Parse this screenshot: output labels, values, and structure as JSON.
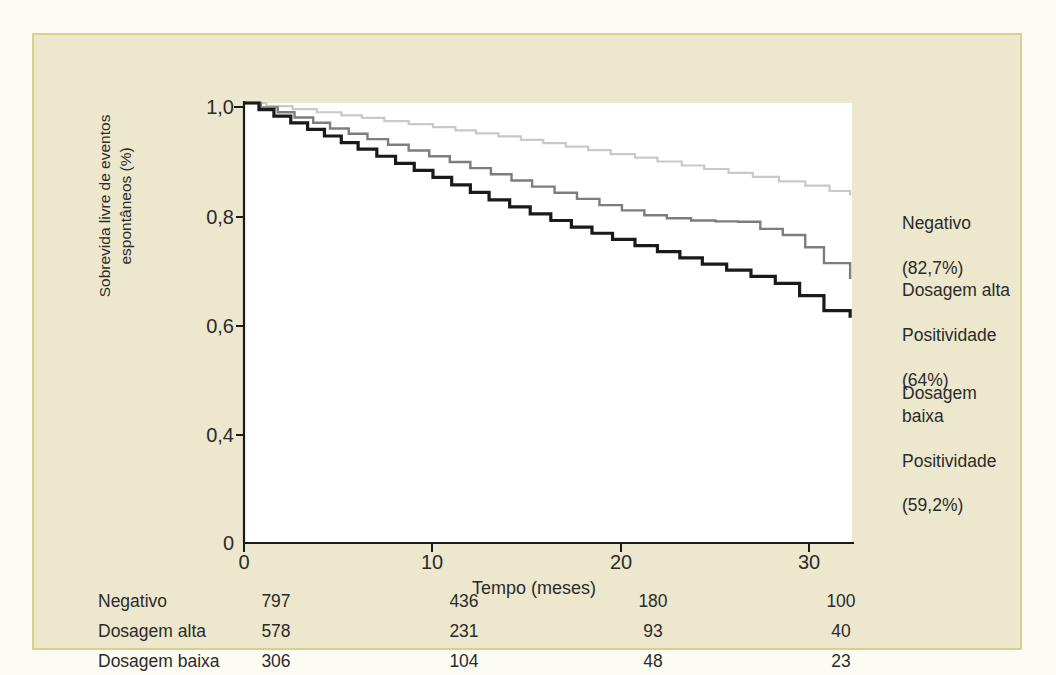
{
  "chart_data": {
    "type": "line",
    "title": "",
    "xlabel": "Tempo (meses)",
    "ylabel": "Sobrevida livre de eventos espontâneos (%)",
    "xlim": [
      0,
      32.5
    ],
    "ylim": [
      0,
      1.0
    ],
    "xticks": [
      0,
      10,
      20,
      30
    ],
    "xticklabels": [
      "0",
      "10",
      "20",
      "30"
    ],
    "yticks": [
      0,
      0.4,
      0.6,
      0.8,
      1.0
    ],
    "yticklabels": [
      "0",
      "0,4",
      "0,6",
      "0,8",
      "1,0"
    ],
    "grid": false,
    "legend_position": "right",
    "step_style": "post",
    "series": [
      {
        "name": "Negativo",
        "annotation": "Negativo\n(82,7%)",
        "final_value": "82,7%",
        "color": "#c9c9c9",
        "x": [
          0,
          1.2,
          2.6,
          3.9,
          5.2,
          6.3,
          7.5,
          8.8,
          10.1,
          11.3,
          12.4,
          13.6,
          14.8,
          16.0,
          17.2,
          18.4,
          19.6,
          20.9,
          22.1,
          23.4,
          24.6,
          25.9,
          27.2,
          28.6,
          30.0,
          31.3,
          32.4
        ],
        "y": [
          1.0,
          0.993,
          0.986,
          0.979,
          0.972,
          0.966,
          0.959,
          0.952,
          0.945,
          0.938,
          0.931,
          0.924,
          0.916,
          0.909,
          0.901,
          0.893,
          0.884,
          0.876,
          0.867,
          0.858,
          0.85,
          0.841,
          0.832,
          0.822,
          0.812,
          0.8,
          0.79
        ]
      },
      {
        "name": "Dosagem alta Positividade",
        "annotation": "Dosagem alta\nPositividade\n(64%)",
        "final_value": "64%",
        "color": "#7d7d7d",
        "x": [
          0,
          0.9,
          1.8,
          2.7,
          3.7,
          4.6,
          5.6,
          6.6,
          7.7,
          8.8,
          9.9,
          11.0,
          12.1,
          13.2,
          14.3,
          15.4,
          16.6,
          17.8,
          19.0,
          20.2,
          21.4,
          22.6,
          23.9,
          25.2,
          26.4,
          27.6,
          28.8,
          30.0,
          31.0,
          32.4
        ],
        "y": [
          1.0,
          0.99,
          0.979,
          0.967,
          0.955,
          0.942,
          0.93,
          0.918,
          0.905,
          0.892,
          0.879,
          0.866,
          0.852,
          0.838,
          0.824,
          0.81,
          0.796,
          0.782,
          0.768,
          0.756,
          0.745,
          0.738,
          0.733,
          0.731,
          0.73,
          0.714,
          0.7,
          0.672,
          0.636,
          0.6
        ]
      },
      {
        "name": "Dosagem baixa Positividade",
        "annotation": "Dosagem baixa\nPositividade\n(59,2%)",
        "final_value": "59,2%",
        "color": "#1a1a1a",
        "x": [
          0,
          0.8,
          1.6,
          2.5,
          3.4,
          4.3,
          5.2,
          6.1,
          7.1,
          8.1,
          9.1,
          10.1,
          11.1,
          12.1,
          13.1,
          14.2,
          15.3,
          16.4,
          17.5,
          18.6,
          19.7,
          20.9,
          22.1,
          23.3,
          24.5,
          25.8,
          27.1,
          28.4,
          29.7,
          31.0,
          32.4
        ],
        "y": [
          1.0,
          0.985,
          0.97,
          0.955,
          0.94,
          0.925,
          0.91,
          0.895,
          0.879,
          0.863,
          0.847,
          0.831,
          0.814,
          0.797,
          0.78,
          0.764,
          0.748,
          0.733,
          0.718,
          0.704,
          0.69,
          0.676,
          0.662,
          0.648,
          0.634,
          0.62,
          0.606,
          0.59,
          0.562,
          0.528,
          0.512
        ]
      }
    ]
  },
  "axis": {
    "y_title_line1": "Sobrevida livre de eventos",
    "y_title_line2": "espontâneos (%)",
    "x_title": "Tempo (meses)",
    "yticklabels": [
      "1,0",
      "0,8",
      "0,6",
      "0,4",
      "0"
    ],
    "xticklabels": [
      "0",
      "10",
      "20",
      "30"
    ]
  },
  "legend": {
    "items": [
      {
        "line1": "Negativo",
        "line2": "(82,7%)",
        "line3": ""
      },
      {
        "line1": "Dosagem alta",
        "line2": "Positividade",
        "line3": "(64%)"
      },
      {
        "line1": "Dosagem baixa",
        "line2": "Positividade",
        "line3": "(59,2%)"
      }
    ]
  },
  "risk_table": {
    "rows": [
      {
        "label": "Negativo",
        "values": [
          "797",
          "436",
          "180",
          "100"
        ]
      },
      {
        "label": "Dosagem alta",
        "values": [
          "578",
          "231",
          "93",
          "40"
        ]
      },
      {
        "label": "Dosagem baixa",
        "values": [
          "306",
          "104",
          "48",
          "23"
        ]
      }
    ]
  },
  "colors": {
    "background": "#ece7cd",
    "frame_border": "#d9cf8e",
    "plot_background": "#ffffff",
    "negativo": "#c9c9c9",
    "dosagem_alta": "#7d7d7d",
    "dosagem_baixa": "#1a1a1a",
    "text": "#2b2b2b"
  }
}
